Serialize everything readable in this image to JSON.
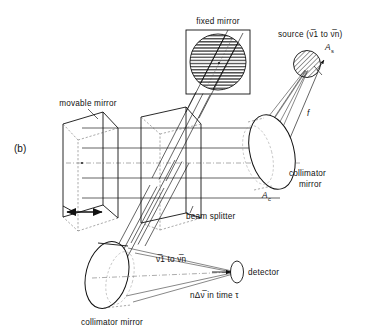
{
  "figure": {
    "panel_label": "(b)",
    "background_color": "#ffffff",
    "line_color": "#111111"
  },
  "labels": {
    "fixed_mirror": "fixed mirror",
    "movable_mirror": "movable mirror",
    "beam_splitter": "beam splitter",
    "collimator_mirror_right": "collimator",
    "collimator_mirror_right2": "mirror",
    "collimator_mirror_bottom": "collimator mirror",
    "detector": "detector",
    "source_prefix": "source (",
    "source_nu1": "ν̅1",
    "source_to": " to ",
    "source_nun": "ν̅n",
    "source_suffix": ")",
    "area_source": "A",
    "area_source_sub": "s",
    "area_collimator": "A",
    "area_collimator_sub": "c",
    "focal_length": "f",
    "beam_range_nu1": "ν̅1",
    "beam_range_to": " to ",
    "beam_range_nun": "ν̅n",
    "throughput": "nΔν̅ in time τ"
  },
  "components": [
    {
      "name": "source",
      "kind": "hatched-disc",
      "cx": 307,
      "cy": 64,
      "r": 14
    },
    {
      "name": "fixed-mirror",
      "kind": "hatched-disc-in-square",
      "cx": 218,
      "cy": 62,
      "r": 28
    },
    {
      "name": "collimator-mirror-right",
      "kind": "ellipse-3d",
      "cx": 272,
      "cy": 152
    },
    {
      "name": "collimator-mirror-bottom",
      "kind": "ellipse-3d",
      "cx": 107,
      "cy": 275
    },
    {
      "name": "beam-splitter",
      "kind": "parallelogram-plane",
      "cx": 163,
      "cy": 172
    },
    {
      "name": "movable-mirror",
      "kind": "parallelogram-plane",
      "cx": 83,
      "cy": 160
    },
    {
      "name": "detector",
      "kind": "small-ellipse",
      "cx": 236,
      "cy": 272
    }
  ]
}
